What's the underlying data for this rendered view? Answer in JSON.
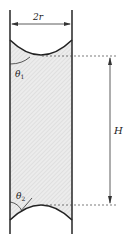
{
  "diagram": {
    "labels": {
      "diameter": "2r",
      "theta_top": "θ",
      "theta_top_sub": "1",
      "theta_bottom": "θ",
      "theta_bottom_sub": "2",
      "height": "H"
    },
    "colors": {
      "line": "#222222",
      "fill": "#e6e6e6",
      "hatch": "#cfcfcf"
    }
  }
}
